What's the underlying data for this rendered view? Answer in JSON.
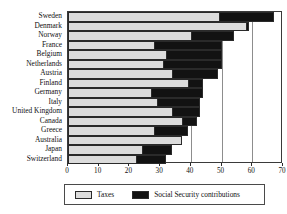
{
  "chart_data": {
    "type": "bar",
    "orientation": "horizontal",
    "stacked": true,
    "title": "",
    "subtitle": "",
    "xlabel": "",
    "ylabel": "",
    "xlim": [
      0,
      70
    ],
    "xticks": [
      0,
      10,
      20,
      30,
      40,
      50,
      60,
      70
    ],
    "xtick_labels": [
      "0",
      "10",
      "20",
      "30",
      "40",
      "50",
      "60",
      "70"
    ],
    "grid": true,
    "grid_axis": "x",
    "legend_position": "bottom",
    "categories": [
      "Sweden",
      "Denmark",
      "Norway",
      "France",
      "Belgium",
      "Netherlands",
      "Austria",
      "Finland",
      "Germany",
      "Italy",
      "United Kingdom",
      "Canada",
      "Greece",
      "Australia",
      "Japan",
      "Switzerland"
    ],
    "series": [
      {
        "name": "Taxes",
        "color": "#dcdcdc",
        "values": [
          49,
          58,
          40,
          28,
          32,
          31,
          34,
          39,
          27,
          29,
          34,
          37,
          28,
          37,
          24,
          22
        ]
      },
      {
        "name": "Social Security contributions",
        "color": "#121212",
        "values": [
          18,
          1,
          14,
          22,
          18,
          19,
          15,
          5,
          17,
          14,
          9,
          5,
          11,
          0,
          10,
          10
        ]
      }
    ],
    "totals": [
      67,
      59,
      54,
      50,
      50,
      50,
      49,
      44,
      44,
      43,
      43,
      42,
      39,
      37,
      34,
      32
    ]
  },
  "legend": {
    "items": [
      {
        "label": "Taxes",
        "swatch": "light-gray-swatch"
      },
      {
        "label": "Social Security contributions",
        "swatch": "black-swatch"
      }
    ]
  }
}
